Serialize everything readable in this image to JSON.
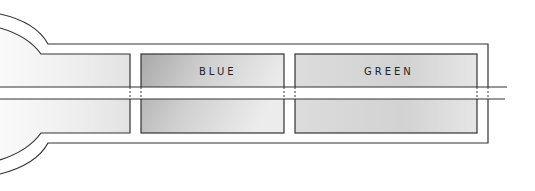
{
  "diagram": {
    "type": "schematic",
    "compartments": [
      {
        "id": "left",
        "label": ""
      },
      {
        "id": "middle",
        "label": "BLUE"
      },
      {
        "id": "right",
        "label": "GREEN"
      }
    ],
    "colors": {
      "line": "#333333",
      "shade_light": "#e4e4e4",
      "shade_dark": "#b8b8b8",
      "background": "#ffffff"
    }
  }
}
